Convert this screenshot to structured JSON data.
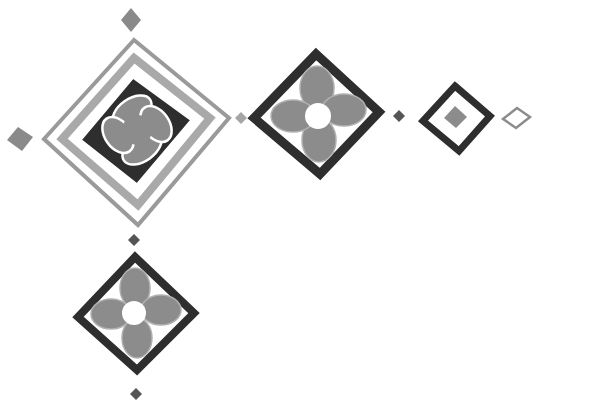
{
  "colors": {
    "background": "#ffffff",
    "dark": "#2e2e2e",
    "mid_gray": "#8c8c8c",
    "light_gray": "#a9a9a9",
    "outline_gray": "#9a9a9a"
  },
  "motifs": [
    {
      "name": "large-quatrefoil-tile",
      "cx": 135,
      "cy": 122
    },
    {
      "name": "medium-flower-tile",
      "cx": 318,
      "cy": 113
    },
    {
      "name": "small-square-tile",
      "cx": 456,
      "cy": 118
    },
    {
      "name": "tiny-outline-diamond",
      "cx": 516,
      "cy": 117
    },
    {
      "name": "lower-flower-tile",
      "cx": 135,
      "cy": 313
    }
  ],
  "dots": [
    {
      "cx": 131,
      "cy": 20,
      "r": 10,
      "shade": "#8a8a8a"
    },
    {
      "cx": 20,
      "cy": 139,
      "r": 12,
      "shade": "#8a8a8a"
    },
    {
      "cx": 241,
      "cy": 118,
      "r": 6,
      "shade": "#a5a5a5"
    },
    {
      "cx": 399,
      "cy": 116,
      "r": 6,
      "shade": "#555555"
    },
    {
      "cx": 134,
      "cy": 240,
      "r": 6,
      "shade": "#555555"
    },
    {
      "cx": 136,
      "cy": 394,
      "r": 6,
      "shade": "#555555"
    }
  ]
}
